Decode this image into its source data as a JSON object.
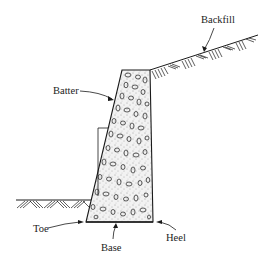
{
  "diagram": {
    "type": "retaining-wall-cross-section",
    "labels": {
      "backfill": "Backfill",
      "batter": "Batter",
      "toe": "Toe",
      "base": "Base",
      "heel": "Heel"
    },
    "colors": {
      "line": "#1a1a1a",
      "fill": "#f4f4f4",
      "background": "#ffffff"
    }
  }
}
